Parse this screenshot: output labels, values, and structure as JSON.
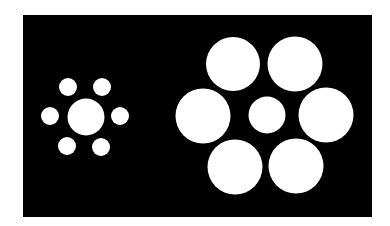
{
  "figure": {
    "background_color": "#ffffff",
    "panel": {
      "x": 23,
      "y": 15,
      "width": 349,
      "height": 202,
      "color": "#000000"
    },
    "circle_color": "#ffffff",
    "left_cluster": {
      "center": {
        "cx": 86,
        "cy": 117,
        "r": 18.5
      },
      "surround": [
        {
          "cx": 68,
          "cy": 87,
          "r": 9
        },
        {
          "cx": 102,
          "cy": 87,
          "r": 9
        },
        {
          "cx": 50,
          "cy": 116,
          "r": 9
        },
        {
          "cx": 120,
          "cy": 116,
          "r": 9
        },
        {
          "cx": 67,
          "cy": 146,
          "r": 9
        },
        {
          "cx": 101,
          "cy": 147,
          "r": 9
        }
      ]
    },
    "right_cluster": {
      "center": {
        "cx": 267,
        "cy": 115,
        "r": 18.5
      },
      "surround": [
        {
          "cx": 233,
          "cy": 64,
          "r": 27
        },
        {
          "cx": 295,
          "cy": 64,
          "r": 27.5
        },
        {
          "cx": 203,
          "cy": 116,
          "r": 27.5
        },
        {
          "cx": 326,
          "cy": 115,
          "r": 27.5
        },
        {
          "cx": 235,
          "cy": 167,
          "r": 27.5
        },
        {
          "cx": 296,
          "cy": 166,
          "r": 27.5
        }
      ]
    }
  }
}
